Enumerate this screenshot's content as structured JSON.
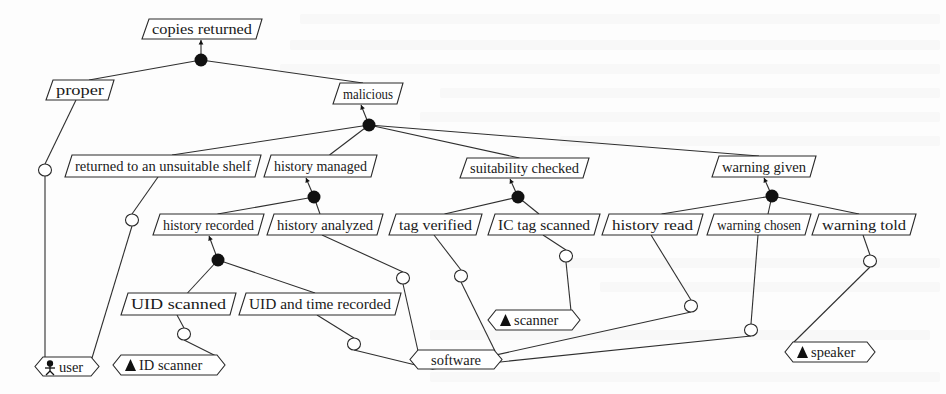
{
  "diagram": {
    "title": "copies returned",
    "goals": [
      {
        "id": "copies_returned",
        "label": "copies returned",
        "x": 143,
        "y": 19,
        "w": 116,
        "h": 20
      },
      {
        "id": "proper",
        "label": "proper",
        "x": 47,
        "y": 80,
        "w": 64,
        "h": 20
      },
      {
        "id": "malicious",
        "label": "malicious",
        "x": 334,
        "y": 83,
        "w": 66,
        "h": 21
      },
      {
        "id": "returned_unsuitable",
        "label": "returned to an unsuitable shelf",
        "x": 66,
        "y": 155,
        "w": 192,
        "h": 22
      },
      {
        "id": "history_managed",
        "label": "history managed",
        "x": 265,
        "y": 155,
        "w": 109,
        "h": 22
      },
      {
        "id": "suitability_checked",
        "label": "suitability  checked",
        "x": 461,
        "y": 158,
        "w": 125,
        "h": 20
      },
      {
        "id": "warning_given",
        "label": "warning given",
        "x": 713,
        "y": 156,
        "w": 100,
        "h": 21
      },
      {
        "id": "history_recorded",
        "label": "history recorded",
        "x": 154,
        "y": 214,
        "w": 107,
        "h": 21
      },
      {
        "id": "history_analyzed",
        "label": "history analyzed",
        "x": 268,
        "y": 214,
        "w": 112,
        "h": 21
      },
      {
        "id": "tag_verified",
        "label": "tag verified",
        "x": 390,
        "y": 214,
        "w": 89,
        "h": 21
      },
      {
        "id": "ic_tag_scanned",
        "label": "IC tag scanned",
        "x": 489,
        "y": 214,
        "w": 108,
        "h": 21
      },
      {
        "id": "history_read",
        "label": "history read",
        "x": 603,
        "y": 214,
        "w": 97,
        "h": 21
      },
      {
        "id": "warning_chosen",
        "label": "warning chosen",
        "x": 708,
        "y": 214,
        "w": 100,
        "h": 21
      },
      {
        "id": "warning_told",
        "label": "warning told",
        "x": 813,
        "y": 214,
        "w": 100,
        "h": 21
      },
      {
        "id": "uid_scanned",
        "label": "UID scanned",
        "x": 122,
        "y": 293,
        "w": 111,
        "h": 22
      },
      {
        "id": "uid_time_recorded",
        "label": "UID and time recorded",
        "x": 240,
        "y": 293,
        "w": 158,
        "h": 22
      }
    ],
    "and_nodes": [
      {
        "id": "and_root",
        "cx": 201,
        "cy": 60,
        "parent": "copies_returned"
      },
      {
        "id": "and_malicious",
        "cx": 369,
        "cy": 125,
        "parent": "malicious"
      },
      {
        "id": "and_history_managed",
        "cx": 314,
        "cy": 197,
        "parent": "history_managed"
      },
      {
        "id": "and_suitability",
        "cx": 518,
        "cy": 197,
        "parent": "suitability_checked"
      },
      {
        "id": "and_warning",
        "cx": 772,
        "cy": 196,
        "parent": "warning_given"
      },
      {
        "id": "and_history_recorded",
        "cx": 218,
        "cy": 260,
        "parent": "history_recorded"
      }
    ],
    "agents": [
      {
        "id": "user",
        "label": "user",
        "icon": "person",
        "x": 35,
        "y": 357,
        "w": 64,
        "h": 19
      },
      {
        "id": "id_scanner",
        "label": "ID scanner",
        "icon": "triangle",
        "x": 113,
        "y": 355,
        "w": 112,
        "h": 20
      },
      {
        "id": "software",
        "label": "software",
        "icon": "none",
        "x": 410,
        "y": 350,
        "w": 92,
        "h": 19
      },
      {
        "id": "scanner",
        "label": "scanner",
        "icon": "triangle",
        "x": 488,
        "y": 310,
        "w": 92,
        "h": 20
      },
      {
        "id": "speaker",
        "label": "speaker",
        "icon": "triangle",
        "x": 785,
        "y": 342,
        "w": 90,
        "h": 20
      }
    ],
    "responsibility_circles": [
      {
        "id": "c_proper",
        "cx": 45,
        "cy": 170,
        "from": "proper",
        "to": "user"
      },
      {
        "id": "c_unsuitable",
        "cx": 132,
        "cy": 220,
        "from": "returned_unsuitable",
        "to": "user"
      },
      {
        "id": "c_uid_scanned",
        "cx": 184,
        "cy": 334,
        "from": "uid_scanned",
        "to": "id_scanner"
      },
      {
        "id": "c_uid_time",
        "cx": 354,
        "cy": 344,
        "from": "uid_time_recorded",
        "to": "software"
      },
      {
        "id": "c_history_analyzed",
        "cx": 403,
        "cy": 278,
        "from": "history_analyzed",
        "to": "software"
      },
      {
        "id": "c_tag_verified",
        "cx": 461,
        "cy": 276,
        "from": "tag_verified",
        "to": "software"
      },
      {
        "id": "c_ic_tag",
        "cx": 566,
        "cy": 256,
        "from": "ic_tag_scanned",
        "to": "scanner"
      },
      {
        "id": "c_history_read",
        "cx": 691,
        "cy": 306,
        "from": "history_read",
        "to": "software"
      },
      {
        "id": "c_warning_chosen",
        "cx": 751,
        "cy": 330,
        "from": "warning_chosen",
        "to": "software"
      },
      {
        "id": "c_warning_told",
        "cx": 870,
        "cy": 261,
        "from": "warning_told",
        "to": "speaker"
      }
    ]
  }
}
